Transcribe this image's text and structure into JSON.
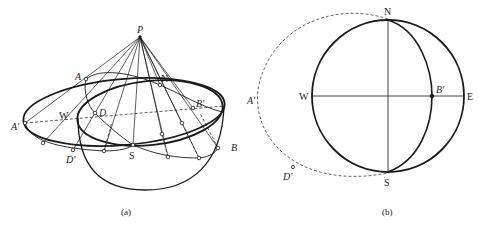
{
  "figure": {
    "panel_a": {
      "caption": "(a)",
      "labels": {
        "P": "P",
        "A": "A",
        "A_prime": "A'",
        "W": "W",
        "D": "D",
        "D_prime": "D'",
        "S": "S",
        "N": "N",
        "B_prime": "B'",
        "B": "B"
      }
    },
    "panel_b": {
      "caption": "(b)",
      "labels": {
        "N": "N",
        "S": "S",
        "W": "W",
        "E": "E",
        "B_prime": "B'",
        "A_prime": "A'",
        "D_prime": "D'"
      }
    },
    "colors": {
      "stroke": "#1a1a1a",
      "dashed": "#555555",
      "background": "#ffffff"
    }
  }
}
